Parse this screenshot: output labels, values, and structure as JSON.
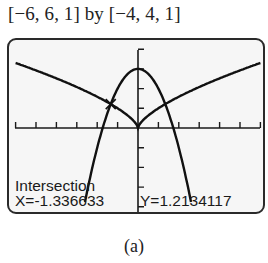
{
  "window": {
    "label": "[−6, 6, 1] by [−4, 4, 1]"
  },
  "readout": {
    "title": "Intersection",
    "x_text": "X=-1.336633",
    "y_text": "Y=1.2134117"
  },
  "caption": "(a)",
  "chart_data": {
    "type": "line",
    "title": "",
    "xlabel": "",
    "ylabel": "",
    "xlim": [
      -6,
      6
    ],
    "ylim": [
      -4,
      4
    ],
    "xscl": 1,
    "yscl": 1,
    "grid": false,
    "series": [
      {
        "name": "y = 3 - x^2",
        "x": [
          -2.5,
          -2,
          -1.5,
          -1,
          -0.5,
          0,
          0.5,
          1,
          1.5,
          2,
          2.5
        ],
        "values": [
          -3.25,
          -1,
          0.75,
          2,
          2.75,
          3,
          2.75,
          2,
          0.75,
          -1,
          -3.25
        ]
      },
      {
        "name": "y = |x|^(2/3)",
        "x": [
          -6,
          -4,
          -2,
          -1,
          0,
          1,
          2,
          4,
          6
        ],
        "values": [
          3.3,
          2.52,
          1.59,
          1,
          0,
          1,
          1.59,
          2.52,
          3.3
        ]
      }
    ],
    "annotations": [
      {
        "type": "intersection-cursor",
        "x": -1.336633,
        "y": 1.2134117,
        "text": "Intersection X=-1.336633 Y=1.2134117"
      }
    ]
  }
}
